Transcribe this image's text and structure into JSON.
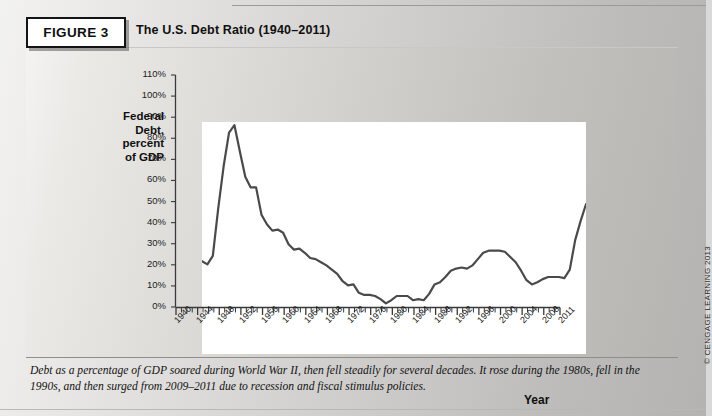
{
  "figure": {
    "label": "FIGURE 3",
    "title": "The U.S. Debt Ratio (1940–2011)",
    "caption": "Debt as a percentage of GDP soared during World War II, then fell steadily for several decades. It rose during the 1980s, fell in the 1990s, and then surged from 2009–2011 due to recession and fiscal stimulus policies.",
    "copyright": "© CENGAGE LEARNING 2013"
  },
  "chart_data": {
    "type": "line",
    "title": "The U.S. Debt Ratio (1940–2011)",
    "xlabel": "Year",
    "ylabel": "Federal Debt, percent of GDP",
    "ylabel_lines": [
      "Federal",
      "Debt,",
      "percent",
      "of GDP"
    ],
    "xlim": [
      1940,
      2011
    ],
    "ylim": [
      0,
      110
    ],
    "ytick_step": 10,
    "ytick_labels": [
      "110%",
      "100%",
      "90%",
      "80%",
      "70%",
      "60%",
      "50%",
      "40%",
      "30%",
      "20%",
      "10%",
      "0%"
    ],
    "ytick_values": [
      110,
      100,
      90,
      80,
      70,
      60,
      50,
      40,
      30,
      20,
      10,
      0
    ],
    "xtick_labels": [
      "1940",
      "1944",
      "1948",
      "1952",
      "1956",
      "1960",
      "1964",
      "1968",
      "1972",
      "1976",
      "1980",
      "1984",
      "1988",
      "1992",
      "1996",
      "2000",
      "2004",
      "2008",
      "2011"
    ],
    "xtick_values": [
      1940,
      1944,
      1948,
      1952,
      1956,
      1960,
      1964,
      1968,
      1972,
      1976,
      1980,
      1984,
      1988,
      1992,
      1996,
      2000,
      2004,
      2008,
      2011
    ],
    "minor_ticks_every": 1,
    "grid": false,
    "legend": false,
    "line_color": "#4a4a4a",
    "line_width": 2.2,
    "x": [
      1940,
      1941,
      1942,
      1943,
      1944,
      1945,
      1946,
      1947,
      1948,
      1949,
      1950,
      1951,
      1952,
      1953,
      1954,
      1955,
      1956,
      1957,
      1958,
      1959,
      1960,
      1961,
      1962,
      1963,
      1964,
      1965,
      1966,
      1967,
      1968,
      1969,
      1970,
      1971,
      1972,
      1973,
      1974,
      1975,
      1976,
      1977,
      1978,
      1979,
      1980,
      1981,
      1982,
      1983,
      1984,
      1985,
      1986,
      1987,
      1988,
      1989,
      1990,
      1991,
      1992,
      1993,
      1994,
      1995,
      1996,
      1997,
      1998,
      1999,
      2000,
      2001,
      2002,
      2003,
      2004,
      2005,
      2006,
      2007,
      2008,
      2009,
      2010,
      2011
    ],
    "y": [
      44,
      42.5,
      46.5,
      69,
      89,
      105,
      108.5,
      96,
      84,
      79,
      79,
      66,
      61.5,
      58.5,
      59,
      57.5,
      52,
      49.5,
      50,
      48,
      45.5,
      45,
      43.5,
      42,
      40,
      38,
      34.5,
      32.5,
      33,
      29,
      28,
      28,
      27.5,
      26,
      24,
      25.5,
      27.5,
      27.5,
      27.5,
      25.5,
      26,
      25.5,
      28.5,
      33,
      34,
      36.5,
      39.5,
      40.5,
      41,
      40.5,
      42,
      45,
      48,
      49,
      49,
      49,
      48.5,
      46,
      43.5,
      39.5,
      35,
      33,
      34,
      35.5,
      36.5,
      36.5,
      36.5,
      36,
      40,
      54,
      63,
      71
    ]
  }
}
